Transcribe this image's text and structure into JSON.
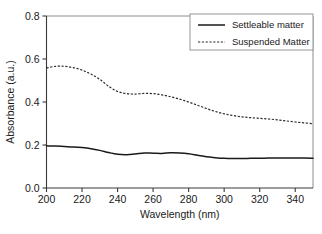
{
  "chart_data": {
    "type": "line",
    "title": "",
    "xlabel": "Wavelength (nm)",
    "ylabel": "Absorbance (a.u.)",
    "xlim": [
      200,
      350
    ],
    "ylim": [
      0.0,
      0.8
    ],
    "xticks": [
      200,
      220,
      240,
      260,
      280,
      300,
      320,
      340
    ],
    "xtick_labels": [
      "200",
      "220",
      "240",
      "260",
      "280",
      "300",
      "320",
      "340"
    ],
    "yticks": [
      0.0,
      0.2,
      0.4,
      0.6,
      0.8
    ],
    "ytick_labels": [
      "0.0",
      "0.2",
      "0.4",
      "0.6",
      "0.8"
    ],
    "grid": false,
    "legend_position": "top-right",
    "series": [
      {
        "name": "Settleable matter",
        "style": "solid",
        "color": "#1a1a1a",
        "x": [
          200,
          205,
          210,
          215,
          220,
          225,
          230,
          235,
          240,
          245,
          250,
          255,
          260,
          265,
          270,
          275,
          280,
          285,
          290,
          295,
          300,
          305,
          310,
          315,
          320,
          325,
          330,
          335,
          340,
          345,
          350
        ],
        "values": [
          0.196,
          0.195,
          0.193,
          0.191,
          0.188,
          0.183,
          0.175,
          0.165,
          0.157,
          0.155,
          0.158,
          0.163,
          0.162,
          0.161,
          0.164,
          0.163,
          0.159,
          0.152,
          0.145,
          0.141,
          0.138,
          0.137,
          0.137,
          0.138,
          0.138,
          0.139,
          0.139,
          0.139,
          0.139,
          0.139,
          0.138
        ]
      },
      {
        "name": "Suspended Matter",
        "style": "dashed",
        "color": "#2a2a2a",
        "x": [
          200,
          205,
          210,
          215,
          220,
          225,
          230,
          235,
          240,
          245,
          250,
          255,
          260,
          265,
          270,
          275,
          280,
          285,
          290,
          295,
          300,
          305,
          310,
          315,
          320,
          325,
          330,
          335,
          340,
          345,
          350
        ],
        "values": [
          0.558,
          0.566,
          0.566,
          0.56,
          0.548,
          0.53,
          0.505,
          0.473,
          0.449,
          0.439,
          0.437,
          0.44,
          0.439,
          0.433,
          0.424,
          0.413,
          0.4,
          0.385,
          0.37,
          0.356,
          0.345,
          0.337,
          0.331,
          0.327,
          0.324,
          0.321,
          0.317,
          0.312,
          0.307,
          0.303,
          0.299
        ]
      }
    ]
  },
  "legend": {
    "items": [
      {
        "label": "Settleable matter",
        "style": "solid"
      },
      {
        "label": "Suspended Matter",
        "style": "dashed"
      }
    ]
  }
}
